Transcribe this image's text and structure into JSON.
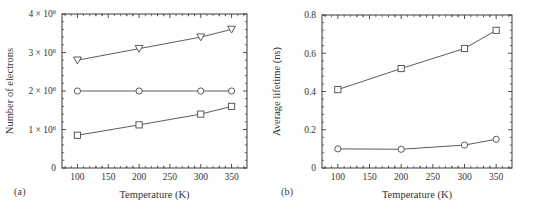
{
  "figure": {
    "panels": [
      {
        "id": "a",
        "caption": "(a)",
        "xlabel": "Temperature (K)",
        "ylabel": "Number of electrons"
      },
      {
        "id": "b",
        "caption": "(b)",
        "xlabel": "Temperature (K)",
        "ylabel": "Average lifetime (ns)"
      }
    ]
  },
  "chart_data": [
    {
      "type": "line",
      "panel": "a",
      "title": "",
      "xlabel": "Temperature (K)",
      "ylabel": "Number of electrons",
      "x": [
        100,
        200,
        300,
        350
      ],
      "xlim": [
        75,
        375
      ],
      "ylim": [
        0,
        4000000
      ],
      "xticks": [
        100,
        150,
        200,
        250,
        300,
        350
      ],
      "xticklabels": [
        "100",
        "150",
        "200",
        "250",
        "300",
        "350"
      ],
      "yticks": [
        0,
        1000000,
        2000000,
        3000000,
        4000000
      ],
      "yticklabels": [
        "0",
        "1 × 10⁶",
        "2 × 10⁶",
        "3 × 10⁶",
        "4 × 10⁶"
      ],
      "ytickmantissas": [
        "0",
        "1",
        "2",
        "3",
        "4"
      ],
      "ytickexponent": "6",
      "grid": false,
      "legend": "none",
      "minor_ticks": true,
      "series": [
        {
          "name": "triangle-series",
          "marker": "triangle-down",
          "values": [
            2800000,
            3100000,
            3400000,
            3600000
          ]
        },
        {
          "name": "circle-series",
          "marker": "circle",
          "values": [
            2000000,
            2000000,
            2000000,
            2000000
          ]
        },
        {
          "name": "square-series",
          "marker": "square",
          "values": [
            850000,
            1120000,
            1400000,
            1600000
          ]
        }
      ]
    },
    {
      "type": "line",
      "panel": "b",
      "title": "",
      "xlabel": "Temperature (K)",
      "ylabel": "Average lifetime (ns)",
      "x": [
        100,
        200,
        300,
        350
      ],
      "xlim": [
        75,
        375
      ],
      "ylim": [
        0,
        0.8
      ],
      "xticks": [
        100,
        150,
        200,
        250,
        300,
        350
      ],
      "xticklabels": [
        "100",
        "150",
        "200",
        "250",
        "300",
        "350"
      ],
      "yticks": [
        0,
        0.2,
        0.4,
        0.6,
        0.8
      ],
      "yticklabels": [
        "0",
        "0.2",
        "0.4",
        "0.6",
        "0.8"
      ],
      "grid": false,
      "legend": "none",
      "minor_ticks": true,
      "series": [
        {
          "name": "square-series",
          "marker": "square",
          "values": [
            0.41,
            0.52,
            0.625,
            0.72
          ]
        },
        {
          "name": "circle-series",
          "marker": "circle",
          "values": [
            0.1,
            0.098,
            0.12,
            0.15
          ]
        }
      ]
    }
  ]
}
